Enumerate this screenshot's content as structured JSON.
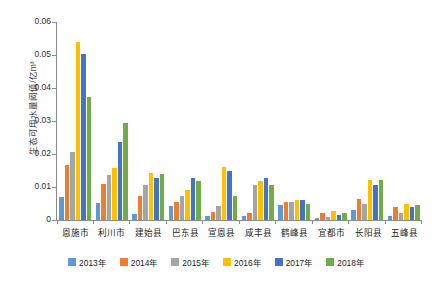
{
  "chart_data": {
    "type": "bar",
    "title": "",
    "subtitle": "",
    "xlabel": "",
    "ylabel": "生态可用水量阈值/亿m³",
    "ylim": [
      0,
      0.06
    ],
    "ytick_labels": [
      "0",
      "0.01",
      "0.02",
      "0.03",
      "0.04",
      "0.05",
      "0.06"
    ],
    "ytick_values": [
      0,
      0.01,
      0.02,
      0.03,
      0.04,
      0.05,
      0.06
    ],
    "grid": false,
    "legend_position": "bottom",
    "categories": [
      "恩施市",
      "利川市",
      "建始县",
      "巴东县",
      "宣恩县",
      "咸丰县",
      "鹤峰县",
      "宜都市",
      "长阳县",
      "五峰县"
    ],
    "series": [
      {
        "name": "2013年",
        "color": "#5b9bd5",
        "values": [
          0.0071,
          0.0053,
          0.0018,
          0.0042,
          0.0012,
          0.0012,
          0.0045,
          0.0006,
          0.003,
          0.0012
        ]
      },
      {
        "name": "2014年",
        "color": "#ed7d31",
        "values": [
          0.0168,
          0.011,
          0.0072,
          0.0055,
          0.0025,
          0.0022,
          0.0055,
          0.0022,
          0.0064,
          0.0038
        ]
      },
      {
        "name": "2015年",
        "color": "#a5a5a5",
        "values": [
          0.0206,
          0.0135,
          0.0105,
          0.0072,
          0.0042,
          0.0105,
          0.0055,
          0.001,
          0.005,
          0.002
        ]
      },
      {
        "name": "2016年",
        "color": "#ffc000",
        "values": [
          0.054,
          0.0158,
          0.0142,
          0.0092,
          0.0162,
          0.0118,
          0.0062,
          0.0028,
          0.0122,
          0.005
        ]
      },
      {
        "name": "2017年",
        "color": "#4472c4",
        "values": [
          0.0502,
          0.0235,
          0.0128,
          0.0128,
          0.015,
          0.0128,
          0.006,
          0.0016,
          0.0105,
          0.004
        ]
      },
      {
        "name": "2018年",
        "color": "#70ad47",
        "values": [
          0.0372,
          0.0293,
          0.0138,
          0.0118,
          0.0072,
          0.0105,
          0.0048,
          0.002,
          0.012,
          0.0046
        ]
      }
    ]
  }
}
